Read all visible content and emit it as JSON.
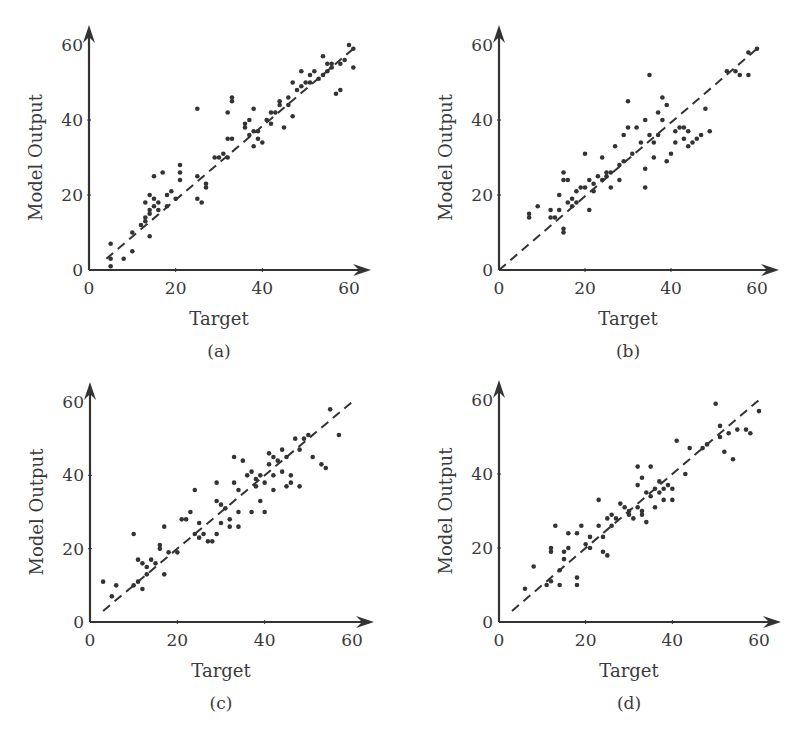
{
  "chart_data": [
    {
      "id": "a",
      "type": "scatter",
      "caption": "(a)",
      "xlabel": "Target",
      "ylabel": "Model Output",
      "xlim": [
        0,
        60
      ],
      "ylim": [
        0,
        60
      ],
      "xticks": [
        "0",
        "20",
        "40",
        "60"
      ],
      "yticks": [
        "0",
        "20",
        "40",
        "60"
      ],
      "grid": false,
      "reference_line": {
        "style": "dashed",
        "from": [
          4,
          3
        ],
        "to": [
          61,
          59
        ]
      },
      "points": [
        [
          5,
          1
        ],
        [
          5,
          3
        ],
        [
          5,
          7
        ],
        [
          8,
          3
        ],
        [
          10,
          5
        ],
        [
          10,
          10
        ],
        [
          12,
          12
        ],
        [
          13,
          13
        ],
        [
          13,
          14
        ],
        [
          13,
          18
        ],
        [
          14,
          15
        ],
        [
          14,
          16
        ],
        [
          14,
          20
        ],
        [
          14,
          9
        ],
        [
          15,
          17
        ],
        [
          15,
          19
        ],
        [
          15,
          25
        ],
        [
          16,
          16
        ],
        [
          16,
          18
        ],
        [
          17,
          26
        ],
        [
          18,
          17
        ],
        [
          18,
          20
        ],
        [
          19,
          21
        ],
        [
          20,
          19
        ],
        [
          21,
          24
        ],
        [
          21,
          26
        ],
        [
          21,
          28
        ],
        [
          25,
          43
        ],
        [
          25,
          25
        ],
        [
          25,
          19
        ],
        [
          26,
          18
        ],
        [
          27,
          22
        ],
        [
          27,
          23
        ],
        [
          29,
          30
        ],
        [
          30,
          30
        ],
        [
          31,
          31
        ],
        [
          32,
          35
        ],
        [
          32,
          42
        ],
        [
          32,
          30
        ],
        [
          33,
          35
        ],
        [
          33,
          45
        ],
        [
          33,
          46
        ],
        [
          36,
          38
        ],
        [
          36,
          39
        ],
        [
          37,
          40
        ],
        [
          37,
          36
        ],
        [
          38,
          37
        ],
        [
          38,
          43
        ],
        [
          38,
          33
        ],
        [
          39,
          37
        ],
        [
          39,
          35
        ],
        [
          40,
          34
        ],
        [
          41,
          40
        ],
        [
          42,
          42
        ],
        [
          42,
          39
        ],
        [
          43,
          42
        ],
        [
          44,
          44
        ],
        [
          44,
          45
        ],
        [
          45,
          38
        ],
        [
          46,
          44
        ],
        [
          46,
          46
        ],
        [
          47,
          50
        ],
        [
          47,
          41
        ],
        [
          48,
          48
        ],
        [
          49,
          49
        ],
        [
          49,
          53
        ],
        [
          50,
          50
        ],
        [
          51,
          50
        ],
        [
          51,
          52
        ],
        [
          52,
          53
        ],
        [
          53,
          51
        ],
        [
          54,
          57
        ],
        [
          54,
          52
        ],
        [
          55,
          53
        ],
        [
          55,
          55
        ],
        [
          56,
          54
        ],
        [
          56,
          55
        ],
        [
          57,
          47
        ],
        [
          58,
          48
        ],
        [
          58,
          55
        ],
        [
          59,
          56
        ],
        [
          60,
          60
        ],
        [
          61,
          59
        ],
        [
          61,
          54
        ]
      ]
    },
    {
      "id": "b",
      "type": "scatter",
      "caption": "(b)",
      "xlabel": "Target",
      "ylabel": "Model Output",
      "xlim": [
        0,
        60
      ],
      "ylim": [
        0,
        60
      ],
      "xticks": [
        "0",
        "20",
        "40",
        "60"
      ],
      "yticks": [
        "0",
        "20",
        "40",
        "60"
      ],
      "grid": false,
      "reference_line": {
        "style": "dashed",
        "from": [
          0,
          0
        ],
        "to": [
          60,
          59
        ]
      },
      "points": [
        [
          7,
          15
        ],
        [
          7,
          14
        ],
        [
          9,
          17
        ],
        [
          12,
          16
        ],
        [
          12,
          14
        ],
        [
          13,
          14
        ],
        [
          14,
          20
        ],
        [
          14,
          16
        ],
        [
          15,
          26
        ],
        [
          15,
          24
        ],
        [
          15,
          11
        ],
        [
          15,
          10
        ],
        [
          16,
          24
        ],
        [
          16,
          18
        ],
        [
          17,
          17
        ],
        [
          17,
          19
        ],
        [
          18,
          18
        ],
        [
          18,
          21
        ],
        [
          19,
          22
        ],
        [
          20,
          22
        ],
        [
          20,
          31
        ],
        [
          21,
          16
        ],
        [
          21,
          24
        ],
        [
          22,
          21
        ],
        [
          22,
          23
        ],
        [
          23,
          25
        ],
        [
          24,
          30
        ],
        [
          24,
          24
        ],
        [
          25,
          26
        ],
        [
          25,
          25
        ],
        [
          26,
          22
        ],
        [
          26,
          26
        ],
        [
          27,
          33
        ],
        [
          28,
          28
        ],
        [
          28,
          24
        ],
        [
          29,
          36
        ],
        [
          29,
          29
        ],
        [
          30,
          38
        ],
        [
          30,
          45
        ],
        [
          31,
          31
        ],
        [
          32,
          38
        ],
        [
          33,
          34
        ],
        [
          34,
          40
        ],
        [
          34,
          27
        ],
        [
          34,
          22
        ],
        [
          35,
          36
        ],
        [
          35,
          52
        ],
        [
          36,
          34
        ],
        [
          36,
          30
        ],
        [
          37,
          42
        ],
        [
          37,
          36
        ],
        [
          38,
          46
        ],
        [
          38,
          40
        ],
        [
          39,
          29
        ],
        [
          39,
          44
        ],
        [
          40,
          31
        ],
        [
          41,
          34
        ],
        [
          41,
          37
        ],
        [
          42,
          38
        ],
        [
          43,
          38
        ],
        [
          43,
          35
        ],
        [
          44,
          33
        ],
        [
          44,
          37
        ],
        [
          45,
          34
        ],
        [
          46,
          35
        ],
        [
          47,
          36
        ],
        [
          48,
          43
        ],
        [
          49,
          37
        ],
        [
          53,
          53
        ],
        [
          55,
          53
        ],
        [
          56,
          52
        ],
        [
          58,
          52
        ],
        [
          58,
          58
        ],
        [
          60,
          59
        ]
      ]
    },
    {
      "id": "c",
      "type": "scatter",
      "caption": "(c)",
      "xlabel": "Target",
      "ylabel": "Model Output",
      "xlim": [
        0,
        60
      ],
      "ylim": [
        0,
        60
      ],
      "xticks": [
        "0",
        "20",
        "40",
        "60"
      ],
      "yticks": [
        "0",
        "20",
        "40",
        "60"
      ],
      "grid": false,
      "reference_line": {
        "style": "dashed",
        "from": [
          3,
          3
        ],
        "to": [
          60,
          60
        ]
      },
      "points": [
        [
          3,
          11
        ],
        [
          5,
          7
        ],
        [
          6,
          10
        ],
        [
          10,
          24
        ],
        [
          10,
          10
        ],
        [
          11,
          17
        ],
        [
          11,
          11
        ],
        [
          12,
          16
        ],
        [
          12,
          9
        ],
        [
          13,
          13
        ],
        [
          13,
          15
        ],
        [
          14,
          17
        ],
        [
          15,
          16
        ],
        [
          16,
          20
        ],
        [
          16,
          21
        ],
        [
          17,
          26
        ],
        [
          17,
          13
        ],
        [
          18,
          19
        ],
        [
          20,
          19
        ],
        [
          21,
          28
        ],
        [
          22,
          28
        ],
        [
          23,
          30
        ],
        [
          24,
          36
        ],
        [
          24,
          24
        ],
        [
          25,
          27
        ],
        [
          25,
          23
        ],
        [
          26,
          24
        ],
        [
          27,
          22
        ],
        [
          28,
          22
        ],
        [
          29,
          38
        ],
        [
          29,
          33
        ],
        [
          29,
          24
        ],
        [
          30,
          27
        ],
        [
          30,
          32
        ],
        [
          31,
          31
        ],
        [
          32,
          26
        ],
        [
          32,
          28
        ],
        [
          33,
          38
        ],
        [
          33,
          45
        ],
        [
          34,
          26
        ],
        [
          34,
          30
        ],
        [
          34,
          36
        ],
        [
          35,
          44
        ],
        [
          36,
          40
        ],
        [
          37,
          30
        ],
        [
          37,
          41
        ],
        [
          38,
          39
        ],
        [
          38,
          37
        ],
        [
          39,
          40
        ],
        [
          39,
          33
        ],
        [
          40,
          30
        ],
        [
          40,
          38
        ],
        [
          41,
          46
        ],
        [
          41,
          43
        ],
        [
          42,
          45
        ],
        [
          42,
          40
        ],
        [
          42,
          36
        ],
        [
          43,
          44
        ],
        [
          44,
          47
        ],
        [
          44,
          41
        ],
        [
          45,
          45
        ],
        [
          45,
          37
        ],
        [
          46,
          40
        ],
        [
          46,
          38
        ],
        [
          47,
          50
        ],
        [
          48,
          47
        ],
        [
          48,
          37
        ],
        [
          49,
          50
        ],
        [
          50,
          51
        ],
        [
          51,
          45
        ],
        [
          53,
          43
        ],
        [
          54,
          42
        ],
        [
          55,
          58
        ],
        [
          57,
          51
        ]
      ]
    },
    {
      "id": "d",
      "type": "scatter",
      "caption": "(d)",
      "xlabel": "Target",
      "ylabel": "Model Output",
      "xlim": [
        0,
        60
      ],
      "ylim": [
        0,
        60
      ],
      "xticks": [
        "0",
        "20",
        "40",
        "60"
      ],
      "yticks": [
        "0",
        "20",
        "40",
        "60"
      ],
      "grid": false,
      "reference_line": {
        "style": "dashed",
        "from": [
          3,
          3
        ],
        "to": [
          60,
          60
        ]
      },
      "points": [
        [
          6,
          9
        ],
        [
          8,
          15
        ],
        [
          11,
          10
        ],
        [
          12,
          11
        ],
        [
          12,
          20
        ],
        [
          12,
          19
        ],
        [
          13,
          26
        ],
        [
          14,
          14
        ],
        [
          14,
          10
        ],
        [
          15,
          17
        ],
        [
          15,
          19
        ],
        [
          16,
          24
        ],
        [
          16,
          20
        ],
        [
          18,
          12
        ],
        [
          18,
          10
        ],
        [
          18,
          24
        ],
        [
          19,
          26
        ],
        [
          20,
          21
        ],
        [
          21,
          20
        ],
        [
          21,
          23
        ],
        [
          23,
          33
        ],
        [
          23,
          26
        ],
        [
          24,
          23
        ],
        [
          24,
          19
        ],
        [
          25,
          28
        ],
        [
          25,
          18
        ],
        [
          26,
          26
        ],
        [
          26,
          29
        ],
        [
          27,
          28
        ],
        [
          28,
          32
        ],
        [
          29,
          31
        ],
        [
          30,
          30
        ],
        [
          30,
          29
        ],
        [
          31,
          28
        ],
        [
          32,
          31
        ],
        [
          32,
          37
        ],
        [
          32,
          42
        ],
        [
          33,
          39
        ],
        [
          33,
          29
        ],
        [
          33,
          30
        ],
        [
          34,
          27
        ],
        [
          34,
          35
        ],
        [
          35,
          34
        ],
        [
          35,
          42
        ],
        [
          36,
          36
        ],
        [
          36,
          31
        ],
        [
          37,
          38
        ],
        [
          37,
          35
        ],
        [
          38,
          36
        ],
        [
          38,
          33
        ],
        [
          39,
          37
        ],
        [
          40,
          33
        ],
        [
          40,
          36
        ],
        [
          41,
          49
        ],
        [
          43,
          40
        ],
        [
          44,
          47
        ],
        [
          47,
          47
        ],
        [
          48,
          48
        ],
        [
          50,
          59
        ],
        [
          51,
          50
        ],
        [
          51,
          53
        ],
        [
          52,
          46
        ],
        [
          53,
          51
        ],
        [
          54,
          44
        ],
        [
          55,
          52
        ],
        [
          57,
          52
        ],
        [
          58,
          51
        ],
        [
          60,
          57
        ]
      ]
    }
  ],
  "style": {
    "ink_color": "#333333",
    "background": "#ffffff"
  }
}
